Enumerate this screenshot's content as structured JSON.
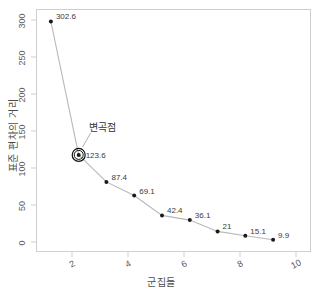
{
  "chart_data": {
    "type": "line",
    "title": "",
    "subtitle": "",
    "xlabel": "군집들",
    "ylabel": "표준 편차의 거리",
    "x": [
      1,
      2,
      3,
      4,
      5,
      6,
      7,
      8,
      9
    ],
    "values": [
      302.6,
      123.6,
      87.4,
      69.1,
      42.4,
      36.1,
      21,
      15.1,
      9.9
    ],
    "point_labels": [
      "302.6",
      "123.6",
      "87.4",
      "69.1",
      "42.4",
      "36.1",
      "21",
      "15.1",
      "9.9"
    ],
    "xlim": [
      0.5,
      10.4
    ],
    "ylim": [
      -8,
      318
    ],
    "xticks": [
      2,
      4,
      6,
      8,
      10
    ],
    "xtick_labels": [
      "2",
      "4",
      "6",
      "8",
      "10"
    ],
    "yticks": [
      0,
      50,
      100,
      150,
      200,
      250,
      300
    ],
    "ytick_labels": [
      "0",
      "50",
      "100",
      "150",
      "200",
      "250",
      "300"
    ],
    "grid": false,
    "legend": "none",
    "series_color": "#b8b8b8",
    "point_color": "#1a1a1a",
    "panel_border_color": "#cfcfcf",
    "annotations": [
      {
        "name": "inflection-point",
        "text": "변곡점",
        "x": 2,
        "y": 123.6,
        "marker": "ringed-point",
        "ring_color": "#111111"
      }
    ]
  },
  "labels": {
    "annotation_elbow": "변곡점"
  }
}
